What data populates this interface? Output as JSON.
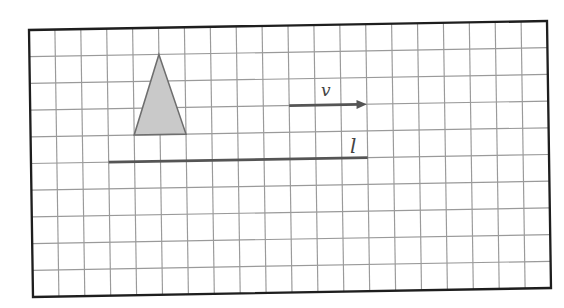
{
  "figure": {
    "grid": {
      "columns": 20,
      "rows": 10,
      "line_color": "#9a9a9a",
      "border_color": "#1e1e1e"
    },
    "triangle": {
      "vertices": [
        [
          5,
          1
        ],
        [
          4,
          4
        ],
        [
          6,
          4
        ]
      ],
      "fill": "#c9c9c9",
      "stroke": "#6e6e6e"
    },
    "vector": {
      "label": "v",
      "from": [
        10,
        3
      ],
      "to": [
        13,
        3
      ],
      "color": "#555555"
    },
    "line": {
      "label": "l",
      "from": [
        3,
        5
      ],
      "to": [
        13,
        5
      ],
      "color": "#555555"
    }
  }
}
